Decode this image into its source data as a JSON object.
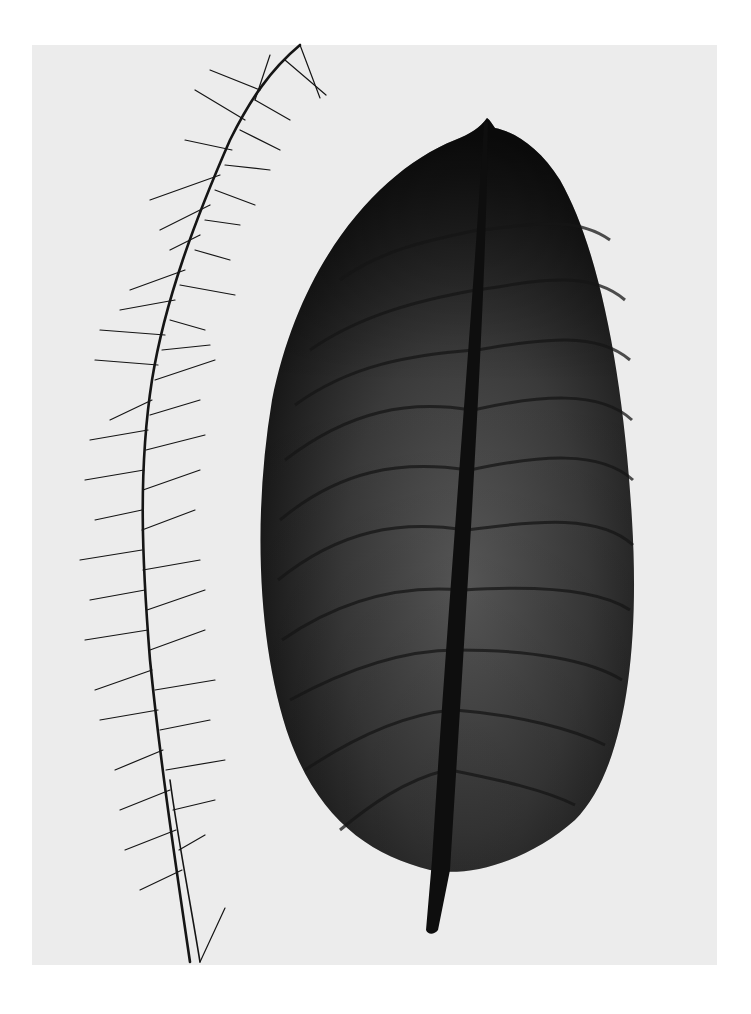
{
  "image": {
    "description": "Black-and-white botanical photogram of a leaf with visible vein network beside a feathery grass stem",
    "colors": {
      "page_background": "#ffffff",
      "panel_background": "#ececec",
      "leaf_dark": "#1a1a1a",
      "leaf_mid": "#4a4a4a",
      "stem": "#111111"
    },
    "subjects": [
      {
        "name": "leaf",
        "type": "broad oval leaf with midrib and lateral veins"
      },
      {
        "name": "grass-stem",
        "type": "feathery grass stem with radiating needle-like spikelets"
      }
    ]
  }
}
